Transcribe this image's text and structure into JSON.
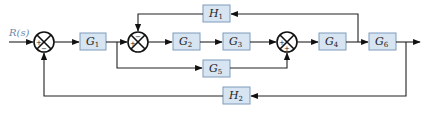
{
  "diagram": {
    "type": "control-system-block-diagram",
    "input_label": "R(s)",
    "blocks": [
      {
        "id": "G1",
        "base": "G",
        "sub": "1"
      },
      {
        "id": "G2",
        "base": "G",
        "sub": "2"
      },
      {
        "id": "G3",
        "base": "G",
        "sub": "3"
      },
      {
        "id": "G4",
        "base": "G",
        "sub": "4"
      },
      {
        "id": "G5",
        "base": "G",
        "sub": "5"
      },
      {
        "id": "G6",
        "base": "G",
        "sub": "6"
      },
      {
        "id": "H1",
        "base": "H",
        "sub": "1"
      },
      {
        "id": "H2",
        "base": "H",
        "sub": "2"
      }
    ],
    "summing_junctions": [
      {
        "id": "S1",
        "signs": {
          "left": "+",
          "bottom": "−"
        }
      },
      {
        "id": "S2",
        "signs": {
          "left": "+",
          "top": "−"
        }
      },
      {
        "id": "S3",
        "signs": {
          "left": "+",
          "bottom": "+"
        }
      }
    ],
    "connections": [
      "R(s) → S1(+)",
      "S1 → G1",
      "G1 → S2(+)",
      "G1 → G5 (feedforward branch)",
      "S2 → G2 → G3 → S3(+)",
      "G5 → S3(+)",
      "S3 → G4 → G6 → output",
      "G4 output → H1 → S2(−)",
      "output → H2 → S1(−)"
    ],
    "colors": {
      "block_fill": "#d7e4f1",
      "block_border": "#7f9cbb",
      "wire": "#222222",
      "input_label": "#6b87a8"
    }
  }
}
